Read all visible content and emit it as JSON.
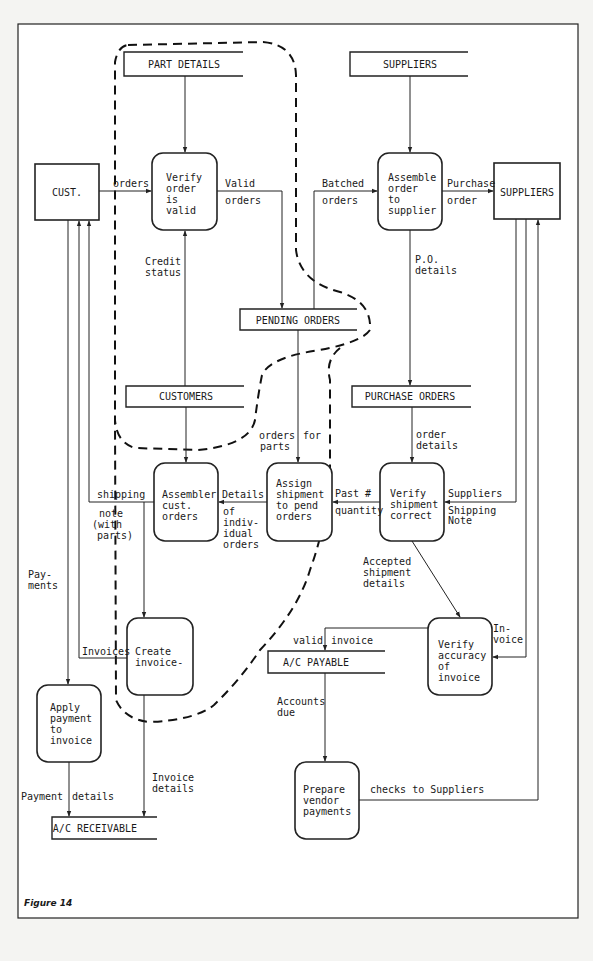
{
  "figure": {
    "caption": "Figure 14"
  },
  "external_entities": {
    "customer": {
      "label": "CUST."
    },
    "suppliers": {
      "label": "SUPPLIERS"
    }
  },
  "data_stores": {
    "part_details": {
      "label": "PART DETAILS"
    },
    "suppliers": {
      "label": "SUPPLIERS"
    },
    "pending_orders": {
      "label": "PENDING ORDERS"
    },
    "customers": {
      "label": "CUSTOMERS"
    },
    "purchase_orders": {
      "label": "PURCHASE ORDERS"
    },
    "ac_payable": {
      "label": "A/C PAYABLE"
    },
    "ac_receivable": {
      "label": "A/C RECEIVABLE"
    }
  },
  "processes": {
    "verify_order": {
      "lines": [
        "Verify",
        "order",
        "is",
        "valid"
      ]
    },
    "assemble_order": {
      "lines": [
        "Assemble",
        "order",
        "to",
        "supplier"
      ]
    },
    "assembler_cust": {
      "lines": [
        "Assembler",
        "cust.",
        "orders"
      ]
    },
    "assign_shipment": {
      "lines": [
        "Assign",
        "shipment",
        "to pend",
        "orders"
      ]
    },
    "verify_shipment": {
      "lines": [
        "Verify",
        "shipment",
        "correct"
      ]
    },
    "create_invoice": {
      "lines": [
        "Create",
        "invoice-"
      ]
    },
    "verify_accuracy": {
      "lines": [
        "Verify",
        "accuracy",
        "of",
        "invoice"
      ]
    },
    "apply_payment": {
      "lines": [
        "Apply",
        "payment",
        "to",
        "invoice"
      ]
    },
    "prepare_vendor": {
      "lines": [
        "Prepare",
        "vendor",
        "payments"
      ]
    }
  },
  "flows": {
    "orders": "orders",
    "valid_orders": [
      "Valid",
      "orders"
    ],
    "batched_orders": [
      "Batched",
      "orders"
    ],
    "purchase_order": [
      "Purchase",
      "order"
    ],
    "credit_status": [
      "Credit",
      "status"
    ],
    "po_details": [
      "P.O.",
      "details"
    ],
    "orders_for_parts": [
      "orders",
      "parts",
      "for"
    ],
    "order_details": [
      "order",
      "details"
    ],
    "shipping_note": [
      "shipping",
      "note",
      "(with",
      "parts)"
    ],
    "details_individual": [
      "Details",
      "of",
      "indiv-",
      "idual",
      "orders"
    ],
    "past_quantity": [
      "Past #",
      "quantity"
    ],
    "suppliers_shipping_note": [
      "Suppliers",
      "Shipping",
      "Note"
    ],
    "payments": [
      "Pay-",
      "ments"
    ],
    "accepted_shipment": [
      "Accepted",
      "shipment",
      "details"
    ],
    "valid_invoice": [
      "valid",
      "invoice"
    ],
    "invoice": [
      "In-",
      "voice"
    ],
    "invoices": "Invoices",
    "accounts_due": [
      "Accounts",
      "due"
    ],
    "invoice_details": [
      "Invoice",
      "details"
    ],
    "payment_details": [
      "Payment",
      "details"
    ],
    "checks_to_suppliers": "checks to Suppliers"
  }
}
